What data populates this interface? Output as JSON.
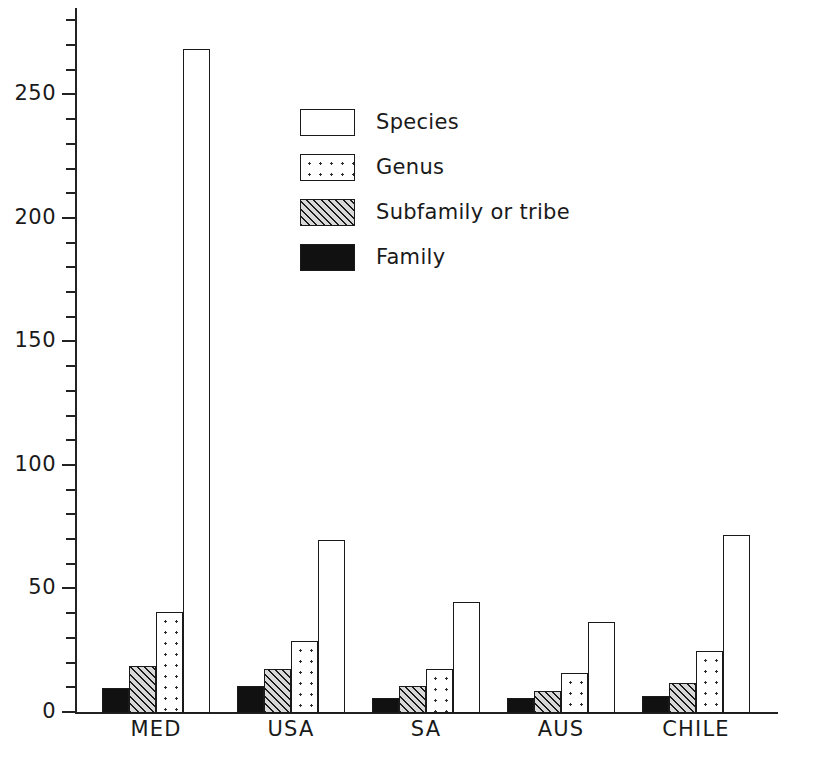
{
  "chart_data": {
    "type": "bar",
    "title": "",
    "xlabel": "",
    "ylabel": "",
    "categories": [
      "MED",
      "USA",
      "SA",
      "AUS",
      "CHILE"
    ],
    "series": [
      {
        "name": "Family",
        "values": [
          10,
          11,
          6,
          6,
          7
        ]
      },
      {
        "name": "Subfamily or tribe",
        "values": [
          19,
          18,
          11,
          9,
          12
        ]
      },
      {
        "name": "Genus",
        "values": [
          41,
          29,
          18,
          16,
          25
        ]
      },
      {
        "name": "Species",
        "values": [
          269,
          70,
          45,
          37,
          72
        ]
      }
    ],
    "ylim": [
      0,
      285
    ],
    "ytick_labels": [
      "0",
      "50",
      "100",
      "150",
      "200",
      "250"
    ],
    "ytick_values": [
      0,
      50,
      100,
      150,
      200,
      250
    ],
    "minor_tick_interval": 10,
    "grid": false,
    "legend_position": "upper-center-left",
    "legend_entries": [
      "Species",
      "Genus",
      "Subfamily or tribe",
      "Family"
    ]
  },
  "axis": {
    "ticks": [
      {
        "label": "250",
        "value": 250
      },
      {
        "label": "200",
        "value": 200
      },
      {
        "label": "150",
        "value": 150
      },
      {
        "label": "100",
        "value": 100
      },
      {
        "label": "50",
        "value": 50
      },
      {
        "label": "0",
        "value": 0
      }
    ]
  }
}
